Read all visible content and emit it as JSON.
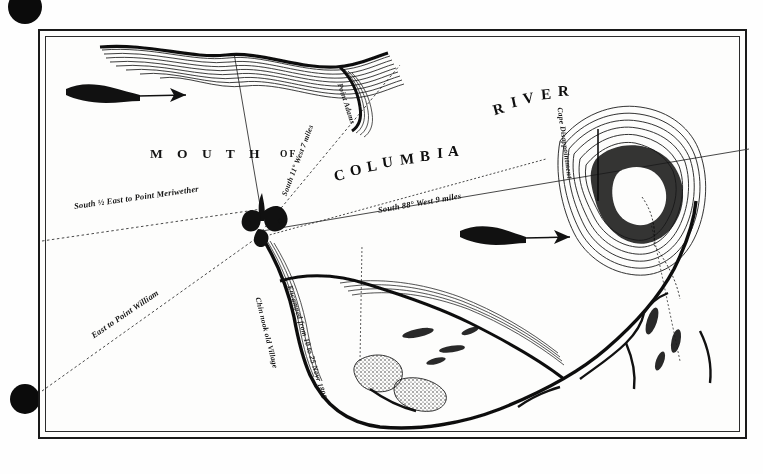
{
  "document": {
    "kind": "engraved-map-plate",
    "title_words": [
      "MOUTH",
      "OF",
      "COLUMBIA",
      "RIVER"
    ],
    "title_mouth": "M O U T H",
    "title_of": "OF",
    "title_columbia": "COLUMBIA",
    "title_river": "RIVER"
  },
  "colors": {
    "ink": "#141414",
    "paper": "#fdfdfc",
    "frame": "#1a1a1a",
    "hole": "#0b0b0b"
  },
  "labels": {
    "bearing_southhalfeast": "South ½ East to Point Meriwether",
    "bearing_east_point_william": "East to Point William",
    "bearing_south_11_west": "South 11° West 7 miles",
    "bearing_south_88_west": "South 88° West 9 miles",
    "point_adams": "Point Adams",
    "cape_disappointment": "Cape Disappointment",
    "chinnook_village": "Chin nook old Village",
    "encampment": "Encamped from 10 to 25 Novr 1805"
  },
  "icons": {
    "compass_rose": "fleur-de-lis-compass-icon",
    "current_arrow_left": "flow-arrow-icon",
    "current_arrow_right": "flow-arrow-icon",
    "punch_hole": "binder-hole-icon"
  },
  "map_features": [
    {
      "name": "north-shore-coastline",
      "type": "coastline"
    },
    {
      "name": "point-adams-headland",
      "type": "headland"
    },
    {
      "name": "cape-disappointment-headland",
      "type": "headland"
    },
    {
      "name": "south-shore-coastline",
      "type": "coastline"
    },
    {
      "name": "sand-bars-shoals",
      "type": "shoal"
    },
    {
      "name": "river-channel",
      "type": "channel"
    },
    {
      "name": "tributary-streams",
      "type": "stream"
    },
    {
      "name": "bearing-line-network",
      "type": "survey-lines"
    }
  ]
}
